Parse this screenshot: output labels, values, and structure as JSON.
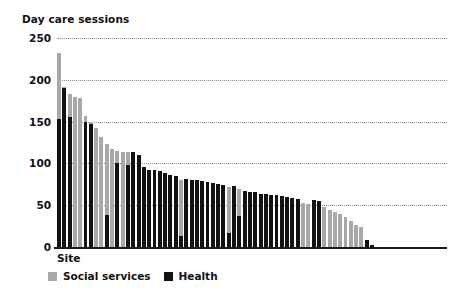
{
  "chart_data": {
    "type": "bar",
    "title": "Day care sessions",
    "xlabel": "Site",
    "ylabel": "",
    "stacked": true,
    "grid": true,
    "legend_position": "bottom-left",
    "ylim": [
      0,
      250
    ],
    "yticks": [
      0,
      50,
      100,
      150,
      200,
      250
    ],
    "ytick_labels": [
      "0",
      "50",
      "100",
      "150",
      "200",
      "250"
    ],
    "categories": [
      "1",
      "2",
      "3",
      "4",
      "5",
      "6",
      "7",
      "8",
      "9",
      "10",
      "11",
      "12",
      "13",
      "14",
      "15",
      "16",
      "17",
      "18",
      "19",
      "20",
      "21",
      "22",
      "23",
      "24",
      "25",
      "26",
      "27",
      "28",
      "29",
      "30",
      "31",
      "32",
      "33",
      "34",
      "35",
      "36",
      "37",
      "38",
      "39",
      "40",
      "41",
      "42",
      "43",
      "44",
      "45",
      "46",
      "47",
      "48",
      "49",
      "50",
      "51",
      "52",
      "53",
      "54",
      "55",
      "56",
      "57",
      "58",
      "59",
      "60"
    ],
    "series": [
      {
        "name": "Health",
        "color": "#121212",
        "values": [
          153,
          190,
          155,
          0,
          0,
          150,
          147,
          0,
          0,
          38,
          0,
          100,
          0,
          98,
          114,
          110,
          96,
          92,
          92,
          91,
          89,
          86,
          85,
          13,
          81,
          80,
          80,
          79,
          78,
          77,
          75,
          74,
          17,
          73,
          37,
          67,
          66,
          66,
          64,
          63,
          62,
          62,
          61,
          60,
          59,
          58,
          0,
          0,
          56,
          55,
          0,
          0,
          0,
          0,
          0,
          0,
          0,
          0,
          8,
          2
        ]
      },
      {
        "name": "Social services",
        "color": "#a8a8a8",
        "values": [
          79,
          2,
          28,
          180,
          178,
          7,
          3,
          142,
          132,
          85,
          117,
          15,
          114,
          16,
          0,
          0,
          0,
          0,
          0,
          0,
          0,
          0,
          0,
          67,
          0,
          0,
          0,
          0,
          0,
          0,
          0,
          0,
          55,
          0,
          33,
          0,
          0,
          0,
          0,
          0,
          0,
          0,
          0,
          0,
          0,
          0,
          53,
          52,
          0,
          0,
          48,
          44,
          42,
          39,
          36,
          31,
          26,
          24,
          0,
          0
        ]
      }
    ]
  },
  "legend": {
    "items": [
      {
        "label": "Social services",
        "color": "#a8a8a8"
      },
      {
        "label": "Health",
        "color": "#121212"
      }
    ]
  }
}
